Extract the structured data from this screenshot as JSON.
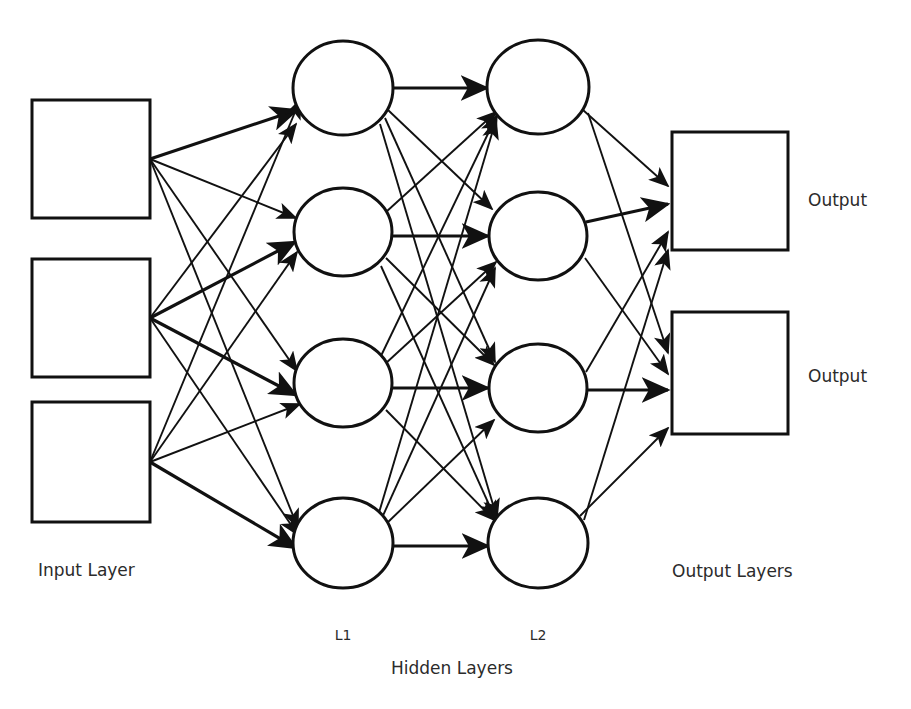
{
  "diagram": {
    "background_color": "#ffffff",
    "stroke_color": "#111111",
    "text_color": "#2b2b2b",
    "labels": {
      "input_layer": "Input Layer",
      "hidden_layers": "Hidden Layers",
      "hidden_l1": "L1",
      "hidden_l2": "L2",
      "output_layers": "Output Layers",
      "output_top": "Output",
      "output_bottom": "Output"
    },
    "input_layer": {
      "name": "Input Layer",
      "node_shape": "square",
      "node_count": 3,
      "nodes": [
        {
          "id": "i1",
          "cx": 91,
          "cy": 159,
          "w": 118,
          "h": 118
        },
        {
          "id": "i2",
          "cx": 91,
          "cy": 318,
          "w": 118,
          "h": 118
        },
        {
          "id": "i3",
          "cx": 91,
          "cy": 462,
          "w": 118,
          "h": 120
        }
      ]
    },
    "hidden_layer_1": {
      "name": "L1",
      "node_shape": "circle",
      "node_count": 4,
      "nodes": [
        {
          "id": "h1_1",
          "cx": 343,
          "cy": 88,
          "rx": 50,
          "ry": 47
        },
        {
          "id": "h1_2",
          "cx": 343,
          "cy": 232,
          "rx": 49,
          "ry": 44
        },
        {
          "id": "h1_3",
          "cx": 343,
          "cy": 383,
          "rx": 49,
          "ry": 44
        },
        {
          "id": "h1_4",
          "cx": 343,
          "cy": 543,
          "rx": 50,
          "ry": 45
        }
      ]
    },
    "hidden_layer_2": {
      "name": "L2",
      "node_shape": "circle",
      "node_count": 4,
      "nodes": [
        {
          "id": "h2_1",
          "cx": 538,
          "cy": 87,
          "rx": 51,
          "ry": 47
        },
        {
          "id": "h2_2",
          "cx": 538,
          "cy": 236,
          "rx": 49,
          "ry": 44
        },
        {
          "id": "h2_3",
          "cx": 538,
          "cy": 388,
          "rx": 49,
          "ry": 44
        },
        {
          "id": "h2_4",
          "cx": 538,
          "cy": 543,
          "rx": 50,
          "ry": 45
        }
      ]
    },
    "output_layer": {
      "name": "Output Layers",
      "node_shape": "square",
      "node_count": 2,
      "nodes": [
        {
          "id": "o1",
          "cx": 730,
          "cy": 191,
          "w": 116,
          "h": 118,
          "label": "Output"
        },
        {
          "id": "o2",
          "cx": 730,
          "cy": 373,
          "w": 116,
          "h": 122,
          "label": "Output"
        }
      ]
    },
    "connections": {
      "pattern": "fully-connected",
      "arrowheads": true,
      "direction": "left-to-right",
      "input_to_l1_count": 12,
      "l1_to_l2_count": 16,
      "l2_to_output_count": 8,
      "total": 36
    }
  }
}
